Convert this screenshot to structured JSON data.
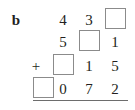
{
  "problem": {
    "label": "b",
    "operator": "+",
    "type": "column-addition-with-blanks",
    "columns": 4,
    "rows": [
      {
        "name": "addend-1",
        "cells": [
          {
            "kind": "empty",
            "value": ""
          },
          {
            "kind": "digit",
            "value": "4"
          },
          {
            "kind": "digit",
            "value": "3"
          },
          {
            "kind": "blank",
            "value": ""
          }
        ]
      },
      {
        "name": "addend-2",
        "cells": [
          {
            "kind": "empty",
            "value": ""
          },
          {
            "kind": "digit",
            "value": "5"
          },
          {
            "kind": "blank",
            "value": ""
          },
          {
            "kind": "digit",
            "value": "1"
          }
        ]
      },
      {
        "name": "addend-3",
        "cells": [
          {
            "kind": "empty",
            "value": ""
          },
          {
            "kind": "blank",
            "value": ""
          },
          {
            "kind": "digit",
            "value": "1"
          },
          {
            "kind": "digit",
            "value": "5"
          }
        ]
      },
      {
        "name": "sum",
        "cells": [
          {
            "kind": "blank",
            "value": ""
          },
          {
            "kind": "digit",
            "value": "0"
          },
          {
            "kind": "digit",
            "value": "7"
          },
          {
            "kind": "digit",
            "value": "2"
          }
        ]
      }
    ]
  },
  "colors": {
    "background": "#ffffff",
    "text": "#231f20",
    "box_border": "#8b8b8b",
    "rule": "#6d6d6d"
  }
}
